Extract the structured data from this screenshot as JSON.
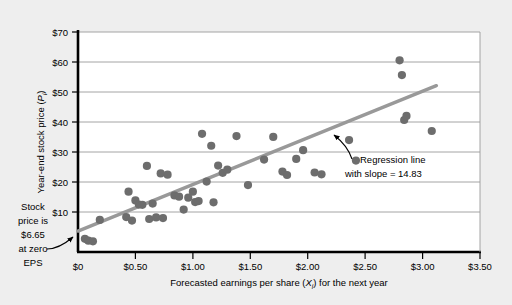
{
  "figure": {
    "background_color": "#eeeeee",
    "plot_background_color": "#ffffff",
    "marker_color": "#6d6d6d",
    "line_color": "#999999",
    "grid_color": "#999999",
    "axis_color": "#000000"
  },
  "axis": {
    "y_title_main": "Year-end stock price (",
    "y_title_var": "P",
    "y_title_sub": "i",
    "y_title_close": ")",
    "x_title_main": "Forecasted earnings per share (",
    "x_title_var": "X",
    "x_title_sub": "i",
    "x_title_close": ") for the next year",
    "y_ticks": [
      "$0",
      "$10",
      "$20",
      "$30",
      "$40",
      "$50",
      "$60",
      "$70"
    ],
    "x_ticks": [
      "$0",
      "$0.50",
      "$1.00",
      "$1.50",
      "$2.00",
      "$2.50",
      "$3.00",
      "$3.50"
    ]
  },
  "annotations": {
    "left_note_lines": [
      "Stock",
      "price is",
      "$6.65",
      "at zero",
      "EPS"
    ],
    "regression_note_lines": [
      "Regression line",
      "with slope  =  14.83"
    ]
  },
  "chart_data": {
    "type": "scatter",
    "title": "",
    "xlabel": "Forecasted earnings per share (Xi) for the next year",
    "ylabel": "Year-end stock price (Pi)",
    "xlim": [
      0,
      3.5
    ],
    "ylim": [
      0,
      70
    ],
    "xticks": [
      0,
      0.5,
      1.0,
      1.5,
      2.0,
      2.5,
      3.0,
      3.5
    ],
    "yticks": [
      0,
      10,
      20,
      30,
      40,
      50,
      60,
      70
    ],
    "xtick_labels": [
      "$0",
      "$0.50",
      "$1.00",
      "$1.50",
      "$2.00",
      "$2.50",
      "$3.00",
      "$3.50"
    ],
    "ytick_labels": [
      "$0",
      "$10",
      "$20",
      "$30",
      "$40",
      "$50",
      "$60",
      "$70"
    ],
    "grid": "horizontal",
    "legend": "none",
    "series": [
      {
        "name": "Observations",
        "marker": "circle",
        "color": "#6d6d6d",
        "points": [
          [
            0.06,
            4.2
          ],
          [
            0.09,
            3.6
          ],
          [
            0.13,
            3.4
          ],
          [
            0.19,
            10.2
          ],
          [
            0.42,
            11.1
          ],
          [
            0.44,
            19.2
          ],
          [
            0.47,
            10.0
          ],
          [
            0.5,
            16.4
          ],
          [
            0.53,
            15.1
          ],
          [
            0.56,
            15.0
          ],
          [
            0.6,
            27.4
          ],
          [
            0.62,
            10.5
          ],
          [
            0.65,
            15.4
          ],
          [
            0.68,
            11.0
          ],
          [
            0.72,
            25.0
          ],
          [
            0.74,
            10.8
          ],
          [
            0.78,
            24.6
          ],
          [
            0.84,
            18.0
          ],
          [
            0.88,
            17.6
          ],
          [
            0.92,
            13.5
          ],
          [
            0.96,
            17.3
          ],
          [
            1.0,
            19.2
          ],
          [
            1.02,
            15.9
          ],
          [
            1.05,
            16.2
          ],
          [
            1.08,
            37.6
          ],
          [
            1.12,
            22.4
          ],
          [
            1.16,
            33.8
          ],
          [
            1.18,
            15.8
          ],
          [
            1.22,
            27.5
          ],
          [
            1.26,
            25.2
          ],
          [
            1.3,
            26.2
          ],
          [
            1.38,
            36.9
          ],
          [
            1.48,
            21.3
          ],
          [
            1.62,
            29.4
          ],
          [
            1.7,
            36.6
          ],
          [
            1.78,
            25.6
          ],
          [
            1.82,
            24.5
          ],
          [
            1.9,
            29.6
          ],
          [
            1.96,
            32.4
          ],
          [
            2.06,
            25.3
          ],
          [
            2.12,
            24.7
          ],
          [
            2.36,
            35.6
          ],
          [
            2.42,
            29.1
          ],
          [
            2.8,
            61.0
          ],
          [
            2.82,
            56.3
          ],
          [
            2.84,
            42.0
          ],
          [
            2.86,
            43.3
          ],
          [
            3.08,
            38.5
          ]
        ]
      }
    ],
    "regression_line": {
      "intercept": 6.65,
      "slope": 14.83,
      "x_start": 0.0,
      "x_end": 3.12,
      "label": "Regression line with slope = 14.83",
      "color": "#999999"
    }
  }
}
